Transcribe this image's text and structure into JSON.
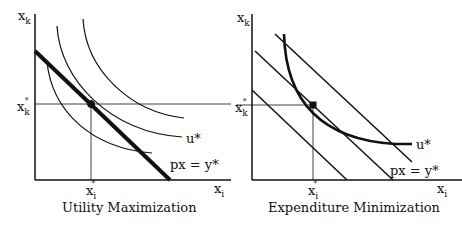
{
  "diagrams": [
    {
      "caption": "Utility Maximization",
      "y_axis": {
        "var": "x",
        "sub": "k"
      },
      "x_axis": {
        "var": "x",
        "sub": "i"
      },
      "y_star": {
        "var": "x",
        "sub": "k",
        "sup": "*"
      },
      "x_star": {
        "var": "x",
        "sub": "i",
        "sup": "*"
      },
      "curve_label": "u*",
      "line_label": "px = y*",
      "description": "Three indifference curves; budget line px = y* tangent to u* at (x_i*, x_k*)"
    },
    {
      "caption": "Expenditure Minimization",
      "y_axis": {
        "var": "x",
        "sub": "k"
      },
      "x_axis": {
        "var": "x",
        "sub": "i"
      },
      "y_star": {
        "var": "x",
        "sub": "k",
        "sup": "*"
      },
      "x_star": {
        "var": "x",
        "sub": "i",
        "sup": "*"
      },
      "curve_label": "u*",
      "line_label": "px = y*",
      "description": "Three parallel budget lines; indifference curve u* tangent to middle line px = y* at (x_i*, x_k*)"
    }
  ]
}
